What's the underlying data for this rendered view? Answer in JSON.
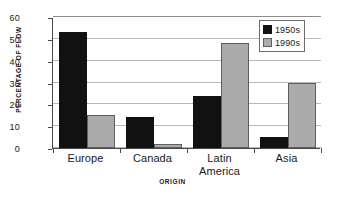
{
  "chart_data": {
    "type": "bar",
    "title": "",
    "subtitle": "",
    "xlabel": "ORIGIN",
    "ylabel": "PERCENTAGE OF FLOW",
    "categories": [
      "Europe",
      "Canada",
      "Latin America",
      "Asia"
    ],
    "category_lines": [
      [
        "Europe"
      ],
      [
        "Canada"
      ],
      [
        "Latin",
        "America"
      ],
      [
        "Asia"
      ]
    ],
    "series": [
      {
        "name": "1950s",
        "color": "#111111",
        "values": [
          53,
          14,
          24,
          5
        ]
      },
      {
        "name": "1990s",
        "color": "#ababab",
        "values": [
          15,
          2,
          48,
          30
        ]
      }
    ],
    "ylim": [
      0,
      60
    ],
    "ytick_values": [
      0,
      10,
      20,
      30,
      40,
      50,
      60
    ],
    "ytick_labels": [
      "0",
      "10",
      "20",
      "30",
      "40",
      "50",
      "60"
    ],
    "grid": "horizontal",
    "legend_position": "top-right",
    "legend_entries": [
      {
        "label": "1950s",
        "swatch": "black-square-marker"
      },
      {
        "label": "1990s",
        "swatch": "gray-square-marker"
      }
    ]
  },
  "colors": {
    "series_1950s": "#111111",
    "series_1990s": "#ababab",
    "axis": "#4a4a4a",
    "gridline": "#b9b9b9",
    "background": "#ffffff",
    "text": "#1a1a1a"
  }
}
